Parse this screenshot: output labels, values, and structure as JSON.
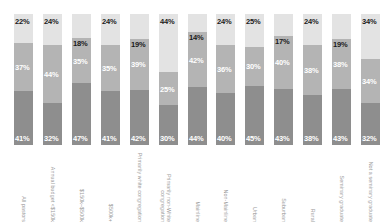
{
  "chart_data": {
    "type": "bar",
    "subtype": "stacked-bar-100",
    "title": "",
    "subtitle": "",
    "xlabel": "",
    "ylabel": "",
    "ylim": [
      0,
      100
    ],
    "grid": false,
    "legend_position": "none",
    "orientation": "vertical",
    "categories": [
      "All pastors",
      "Annual budget <$150k",
      "$150k–$500k",
      "$500k+",
      "Primarily white congregation",
      "Primarily non-White congregation",
      "Mainline",
      "Non-Mainline",
      "Urban",
      "Suburban",
      "Rural",
      "Seminary graduate",
      "Not a seminary graduate"
    ],
    "series": [
      {
        "name": "Top segment",
        "color": "#e3e3e3",
        "values": [
          22,
          24,
          18,
          24,
          19,
          44,
          14,
          24,
          25,
          17,
          24,
          19,
          34
        ],
        "labels": [
          "22%",
          "24%",
          "18%",
          "24%",
          "19%",
          "44%",
          "14%",
          "24%",
          "25%",
          "17%",
          "24%",
          "19%",
          "34%"
        ]
      },
      {
        "name": "Middle segment",
        "color": "#b4b4b4",
        "values": [
          37,
          44,
          35,
          35,
          39,
          25,
          42,
          36,
          30,
          40,
          38,
          38,
          34
        ],
        "labels": [
          "37%",
          "44%",
          "35%",
          "35%",
          "39%",
          "25%",
          "42%",
          "36%",
          "30%",
          "40%",
          "38%",
          "38%",
          "34%"
        ]
      },
      {
        "name": "Bottom segment",
        "color": "#8e8e8e",
        "values": [
          41,
          32,
          47,
          41,
          42,
          30,
          44,
          40,
          45,
          43,
          38,
          43,
          32
        ],
        "labels": [
          "41%",
          "32%",
          "47%",
          "41%",
          "42%",
          "30%",
          "44%",
          "40%",
          "45%",
          "43%",
          "38%",
          "43%",
          "32%"
        ]
      }
    ]
  },
  "colors": {
    "segment_top": "#e3e3e3",
    "segment_middle": "#b4b4b4",
    "segment_bottom": "#8e8e8e",
    "label_dark": "#1a1a1a",
    "label_light": "#ffffff",
    "axis_label": "#9a9a9a",
    "background": "#ffffff"
  }
}
